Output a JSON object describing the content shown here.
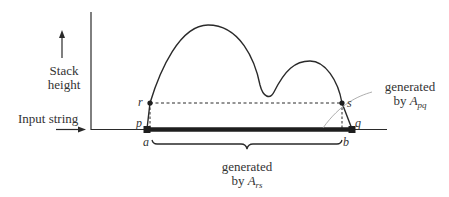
{
  "diagram": {
    "y_axis_label_line1": "Stack",
    "y_axis_label_line2": "height",
    "x_axis_label": "Input string",
    "points": {
      "r": "r",
      "s": "s",
      "p": "p",
      "q": "q",
      "a": "a",
      "b": "b"
    },
    "label_apq_line1": "generated",
    "label_apq_line2_prefix": "by ",
    "label_apq_var": "A",
    "label_apq_sub": "pq",
    "label_ars_line1": "generated",
    "label_ars_line2_prefix": "by ",
    "label_ars_var": "A",
    "label_ars_sub": "rs",
    "colors": {
      "ink": "#2a2a2a",
      "leader": "#999999"
    }
  }
}
